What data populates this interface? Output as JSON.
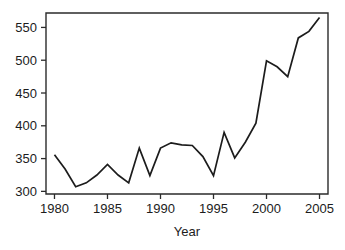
{
  "chart_data": {
    "type": "line",
    "title": "",
    "subtitle": "",
    "xlabel": "Year",
    "ylabel": "",
    "grid": false,
    "legend": false,
    "legend_position": "none",
    "xlim": [
      1979.2,
      2005.8
    ],
    "ylim": [
      296,
      572
    ],
    "xticks": [
      1980,
      1985,
      1990,
      1995,
      2000,
      2005
    ],
    "xtick_labels": [
      "1980",
      "1985",
      "1990",
      "1995",
      "2000",
      "2005"
    ],
    "yticks": [
      300,
      350,
      400,
      450,
      500,
      550
    ],
    "ytick_labels": [
      "300",
      "350",
      "400",
      "450",
      "500",
      "550"
    ],
    "line_color": "#1c1c1c",
    "axis_color": "#2b2b2b",
    "background_color": "#ffffff",
    "x": [
      1980,
      1981,
      1982,
      1983,
      1984,
      1985,
      1986,
      1987,
      1988,
      1989,
      1990,
      1991,
      1992,
      1993,
      1994,
      1995,
      1996,
      1997,
      1998,
      1999,
      2000,
      2001,
      2002,
      2003,
      2004,
      2005
    ],
    "values": [
      356,
      334,
      307,
      313,
      325,
      341,
      325,
      313,
      366,
      324,
      366,
      374,
      371,
      370,
      353,
      324,
      390,
      351,
      375,
      404,
      499,
      490,
      475,
      534,
      544,
      565
    ],
    "series": [
      {
        "name": "series-1",
        "values": [
          356,
          334,
          307,
          313,
          325,
          341,
          325,
          313,
          366,
          324,
          366,
          374,
          371,
          370,
          353,
          324,
          390,
          351,
          375,
          404,
          499,
          490,
          475,
          534,
          544,
          565
        ]
      }
    ],
    "annotations": []
  },
  "axis": {
    "x_label": "Year"
  }
}
